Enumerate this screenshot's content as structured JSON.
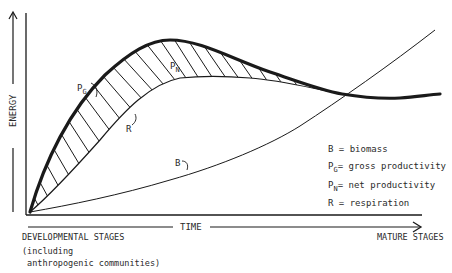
{
  "diagram": {
    "type": "ecological-succession-energy-curves",
    "axes": {
      "y_label": "ENERGY",
      "x_label": "TIME",
      "x_start_label": "DEVELOPMENTAL STAGES",
      "x_start_note_line1": "(including",
      "x_start_note_line2": " anthropogenic communities)",
      "x_end_label": "MATURE STAGES"
    },
    "curves": {
      "pg": {
        "symbol": "P",
        "sub": "G",
        "style": "thick"
      },
      "pn": {
        "symbol": "P",
        "sub": "N",
        "style": "hatched-area"
      },
      "r": {
        "symbol": "R",
        "style": "thin"
      },
      "b": {
        "symbol": "B",
        "style": "thin"
      }
    },
    "legend": {
      "b": {
        "symbol": "B",
        "text": " = biomass"
      },
      "pg": {
        "symbol": "P",
        "sub": "G",
        "text": "= gross productivity"
      },
      "pn": {
        "symbol": "P",
        "sub": "N",
        "text": "= net productivity"
      },
      "r": {
        "symbol": "R",
        "text": " = respiration"
      }
    },
    "colors": {
      "ink": "#1a1a1a",
      "background": "#ffffff"
    }
  }
}
